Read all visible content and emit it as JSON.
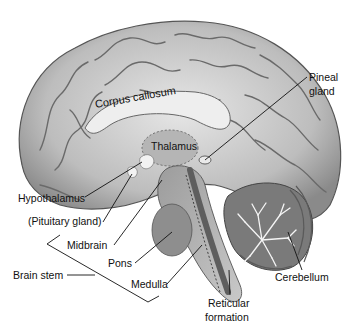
{
  "diagram": {
    "labels": {
      "corpus_callosum": "Corpus callosum",
      "thalamus": "Thalamus",
      "pineal_gland_1": "Pineal",
      "pineal_gland_2": "gland",
      "hypothalamus": "Hypothalamus",
      "pituitary_gland": "(Pituitary gland)",
      "midbrain": "Midbrain",
      "pons": "Pons",
      "brain_stem": "Brain stem",
      "medulla": "Medulla",
      "reticular_formation_1": "Reticular",
      "reticular_formation_2": "formation",
      "cerebellum": "Cerebellum"
    },
    "colors": {
      "cortex_light": "#d9d9d9",
      "cortex_mid": "#a8a8a8",
      "cortex_dark": "#6e6e6e",
      "corpus_callosum": "#ececec",
      "brainstem": "#9a9a9a",
      "reticular_band": "#5e5e5e",
      "cerebellum": "#7a7a7a",
      "line": "#111111"
    }
  }
}
